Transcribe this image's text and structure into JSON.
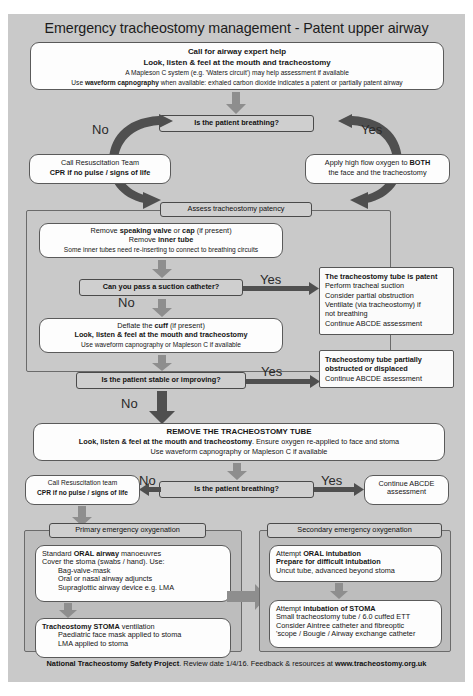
{
  "title": "Emergency tracheostomy management - Patent upper airway",
  "top_box": {
    "line1": "Call for airway expert help",
    "line2": "Look, listen & feel at the mouth and tracheostomy",
    "line3": "A Mapleson C system (e.g. 'Waters circuit') may help assessment if available",
    "line4_a": "Use ",
    "line4_b": "waveform capnography",
    "line4_c": " when available:  exhaled carbon dioxide indicates a patent or partially patent airway"
  },
  "decision1": {
    "label": "Is the patient breathing?",
    "no_label": "No",
    "yes_label": "Yes"
  },
  "resus_box_1": {
    "line1": "Call Resuscitation Team",
    "line2": "CPR if no pulse / signs of life"
  },
  "oxygen_box": {
    "line1_a": "Apply high flow oxygen to ",
    "line1_b": "BOTH",
    "line2": "the face and the tracheostomy"
  },
  "assess_header": "Assess tracheostomy patency",
  "remove_valve_box": {
    "line1_a": "Remove ",
    "line1_b": "speaking valve",
    "line1_c": " or ",
    "line1_d": "cap",
    "line1_e": " (if present)",
    "line2_a": "Remove ",
    "line2_b": "inner tube",
    "line3": "Some inner tubes need re-inserting to connect to breathing circuits"
  },
  "decision2": {
    "label": "Can you pass a suction catheter?",
    "yes_label": "Yes",
    "no_label": "No"
  },
  "patent_box": {
    "line1": "The tracheostomy tube is patent",
    "line2": "Perform tracheal suction",
    "line3": "Consider partial obstruction",
    "line4": "Ventilate (via tracheostomy) if",
    "line5": "not breathing",
    "line6": "Continue ABCDE assessment"
  },
  "deflate_box": {
    "line1_a": "Deflate the ",
    "line1_b": "cuff",
    "line1_c": " (if present)",
    "line2": "Look, listen & feel at the mouth and tracheostomy",
    "line3": "Use waveform capnography or Mapleson C if available"
  },
  "decision3": {
    "label": "Is the patient stable or improving?",
    "yes_label": "Yes",
    "no_label": "No"
  },
  "partial_box": {
    "line1": "Tracheostomy tube partially",
    "line2": "obstructed or displaced",
    "line3": "Continue ABCDE assessment"
  },
  "remove_tube_box": {
    "line1": "REMOVE THE TRACHEOSTOMY TUBE",
    "line2_a": "Look, listen & feel at the mouth and tracheostomy",
    "line2_b": ". Ensure oxygen re-applied to face and stoma",
    "line3": "Use waveform capnography or Mapleson C if available"
  },
  "decision4": {
    "label": "Is the patient breathing?",
    "no_label": "No",
    "yes_label": "Yes"
  },
  "resus_box_2": {
    "line1": "Call Resuscitation team",
    "line2": "CPR if no pulse / signs of life"
  },
  "continue_box": {
    "line1": "Continue ABCDE",
    "line2": "assessment"
  },
  "primary_panel": {
    "header": "Primary emergency oxygenation",
    "box1": {
      "line1_a": "Standard ",
      "line1_b": "ORAL airway",
      "line1_c": " manoeuvres",
      "line2": "Cover the stoma (swabs / hand). Use:",
      "line3": "Bag-valve-mask",
      "line4": "Oral or nasal airway adjuncts",
      "line5": "Supraglottic airway device e.g. LMA"
    },
    "box2": {
      "line1_a": "Tracheostomy STOMA",
      "line1_b": " ventilation",
      "line2": "Paediatric face mask applied to stoma",
      "line3": "LMA applied to stoma"
    }
  },
  "secondary_panel": {
    "header": "Secondary emergency oxygenation",
    "box1": {
      "line1_a": "Attempt ",
      "line1_b": "ORAL intubation",
      "line2": "Prepare for difficult intubation",
      "line3": "Uncut tube, advanced beyond stoma"
    },
    "box2": {
      "line1_a": "Attempt ",
      "line1_b": "intubation of STOMA",
      "line2": "Small tracheostomy tube / 6.0 cuffed ETT",
      "line3": "Consider Aintree catheter and fibreoptic",
      "line4": "'scope / Bougie / Airway exchange catheter"
    }
  },
  "footer": {
    "bold1": "National Tracheostomy Safety Project",
    "regular": ". Review date 1/4/16. Feedback & resources at ",
    "bold2": "www.tracheostomy.org.uk"
  },
  "colors": {
    "background": "#c9c9c9",
    "panel": "#bdbdbd",
    "grey_box": "#cfcfcf",
    "white_box": "#fdfdfd",
    "arrow_light": "#8e8e8e",
    "arrow_dark": "#4f4f4f"
  }
}
